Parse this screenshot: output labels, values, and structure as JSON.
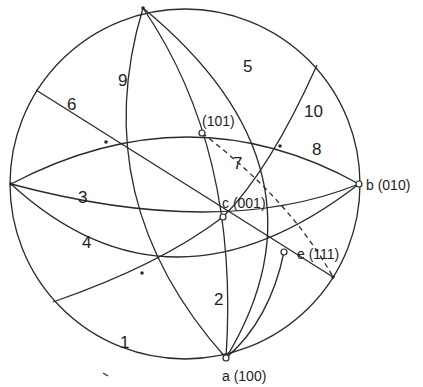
{
  "diagram": {
    "type": "stereographic-projection",
    "colors": {
      "line": "#2a2a2a",
      "background": "#ffffff"
    },
    "poles": [
      {
        "id": "a",
        "label": "a (100)"
      },
      {
        "id": "b",
        "label": "b (010)"
      },
      {
        "id": "c",
        "label": "c (001)"
      },
      {
        "id": "e",
        "label": "e (111)"
      },
      {
        "id": "p101",
        "label": "(101)"
      }
    ],
    "zones": [
      {
        "number": "1"
      },
      {
        "number": "2"
      },
      {
        "number": "3"
      },
      {
        "number": "4"
      },
      {
        "number": "5"
      },
      {
        "number": "6"
      },
      {
        "number": "7"
      },
      {
        "number": "8"
      },
      {
        "number": "9"
      },
      {
        "number": "10"
      }
    ]
  }
}
